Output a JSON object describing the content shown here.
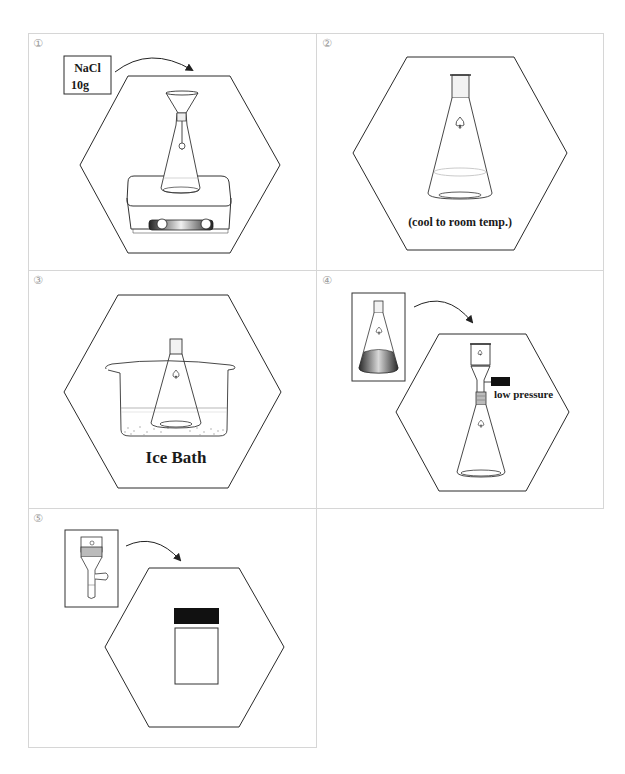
{
  "figure": {
    "layout": "3 rows x 2 columns grid of numbered procedure steps, last cell empty",
    "panels": [
      {
        "number": "①",
        "step": 1,
        "reagent_box": {
          "line1": "NaCl",
          "line2": "10g"
        },
        "description": "Erlenmeyer flask with funnel and stir bar on a hot plate / magnetic stirrer; NaCl 10g being added (arrow)",
        "icons": [
          "reagent-box",
          "arrow-icon",
          "funnel-icon",
          "erlenmeyer-flask-icon",
          "hot-plate-stirrer-icon"
        ]
      },
      {
        "number": "②",
        "step": 2,
        "caption": "(cool to room temp.)",
        "description": "Stoppered Erlenmeyer flask containing solution",
        "icons": [
          "stoppered-flask-icon"
        ]
      },
      {
        "number": "③",
        "step": 3,
        "caption": "Ice Bath",
        "description": "Stoppered Erlenmeyer flask sitting in a beaker of ice water",
        "icons": [
          "beaker-icon",
          "stoppered-flask-icon",
          "ice-icon"
        ]
      },
      {
        "number": "④",
        "step": 4,
        "caption": "low pressure",
        "description": "Flask with dark liquid poured (arrow) into a fritted glass filter funnel on a suction (filter) flask connected to vacuum",
        "icons": [
          "flask-with-liquid-icon",
          "arrow-icon",
          "fritted-funnel-icon",
          "vacuum-hose-icon",
          "filter-flask-icon"
        ]
      },
      {
        "number": "⑤",
        "step": 5,
        "description": "Solid on fritted funnel transferred (arrow) to a sample vial with black cap",
        "icons": [
          "fritted-funnel-icon",
          "arrow-icon",
          "sample-vial-icon"
        ]
      }
    ]
  },
  "colors": {
    "grid": "#d6d6d6",
    "line": "#2a2a2a",
    "panel_number": "#9a9a9a",
    "black_fill": "#111111"
  }
}
